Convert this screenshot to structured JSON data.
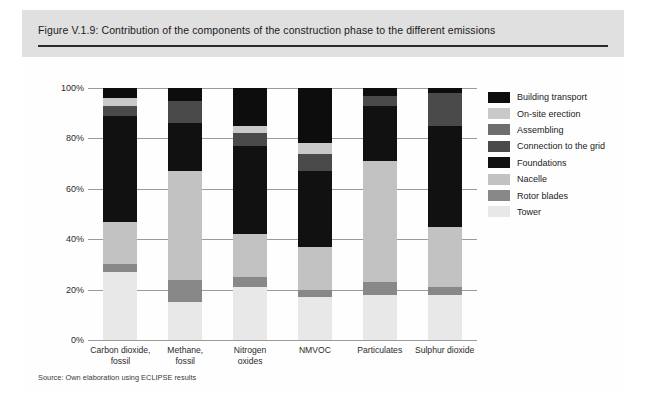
{
  "figure": {
    "title": "Figure V.1.9: Contribution of the components of the construction phase to the different emissions",
    "source": "Source: Own elaboration using ECLIPSE results"
  },
  "colors": {
    "panel_band": "#e0e0e0",
    "rule": "#2a2a2a",
    "gridline": "#9a9a9a",
    "building_transport": "#0d0d0d",
    "on_site_erection": "#c9c9c9",
    "assembling": "#6e6e6e",
    "connection_to_the_grid": "#4a4a4a",
    "foundations": "#111111",
    "nacelle": "#c2c2c2",
    "rotor_blades": "#888888",
    "tower": "#e8e8e8"
  },
  "legend": {
    "items": [
      {
        "label": "Building transport",
        "color": "#0d0d0d"
      },
      {
        "label": "On-site erection",
        "color": "#c9c9c9"
      },
      {
        "label": "Assembling",
        "color": "#6e6e6e"
      },
      {
        "label": "Connection to the grid",
        "color": "#4a4a4a"
      },
      {
        "label": "Foundations",
        "color": "#111111"
      },
      {
        "label": "Nacelle",
        "color": "#c2c2c2"
      },
      {
        "label": "Rotor blades",
        "color": "#888888"
      },
      {
        "label": "Tower",
        "color": "#e8e8e8"
      }
    ]
  },
  "chart_data": {
    "type": "bar",
    "stacked": true,
    "stack_total": 100,
    "title": "Contribution of the components of the construction phase to the different emissions",
    "xlabel": "",
    "ylabel": "",
    "ylim": [
      0,
      100
    ],
    "ytick_labels": [
      "0%",
      "20%",
      "40%",
      "60%",
      "80%",
      "100%"
    ],
    "ytick_values": [
      0,
      20,
      40,
      60,
      80,
      100
    ],
    "grid": true,
    "legend_position": "right",
    "categories": [
      "Carbon dioxide,\nfossil",
      "Methane,\nfossil",
      "Nitrogen\noxides",
      "NMVOC",
      "Particulates",
      "Sulphur dioxide"
    ],
    "series": [
      {
        "name": "Tower",
        "color": "#e8e8e8",
        "values": [
          27,
          15,
          21,
          17,
          18,
          18
        ]
      },
      {
        "name": "Rotor blades",
        "color": "#888888",
        "values": [
          3,
          9,
          4,
          3,
          5,
          3
        ]
      },
      {
        "name": "Nacelle",
        "color": "#c2c2c2",
        "values": [
          17,
          43,
          17,
          17,
          48,
          24
        ]
      },
      {
        "name": "Foundations",
        "color": "#111111",
        "values": [
          42,
          19,
          35,
          30,
          22,
          40
        ]
      },
      {
        "name": "Connection to the grid",
        "color": "#4a4a4a",
        "values": [
          4,
          9,
          5,
          7,
          4,
          13
        ]
      },
      {
        "name": "Assembling",
        "color": "#6e6e6e",
        "values": [
          0,
          0,
          0,
          0,
          0,
          0
        ]
      },
      {
        "name": "On-site erection",
        "color": "#c9c9c9",
        "values": [
          3,
          0,
          3,
          4,
          0,
          0
        ]
      },
      {
        "name": "Building transport",
        "color": "#0d0d0d",
        "values": [
          4,
          5,
          15,
          22,
          3,
          2
        ]
      }
    ]
  }
}
